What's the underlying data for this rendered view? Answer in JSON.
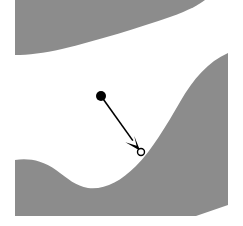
{
  "figure": {
    "width": 243,
    "height": 226,
    "background_color": "#ffffff",
    "region_color": "#8c8c8c",
    "annotation_color": "#000000",
    "marker_open_fill": "#ffffff"
  },
  "regions": [
    {
      "name": "upper-gray-region",
      "description": "Gray band across the top, tapering to a tip at upper right, concave lower edge",
      "path": "M 15 0 L 205 0 C 200 4 190 10 170 17 C 140 27 100 40 62 49 C 44 53 28 55 15 55 Z",
      "color": "#8c8c8c"
    },
    {
      "name": "lower-right-gray-region",
      "description": "Large gray region occupying the lower portion, with an S-shaped upper boundary rising to the right and a valley near the left",
      "path": "M 15 160 C 28 158 42 160 56 170 C 68 179 76 186 88 188 C 104 190 120 182 136 166 C 152 150 166 126 180 102 C 194 78 208 62 228 53 L 228 205 L 196 216 L 15 216 Z",
      "color": "#8c8c8c"
    }
  ],
  "annotation": {
    "name": "boundary-pointer-arrow",
    "start_point": {
      "x": 101,
      "y": 96,
      "marker": "filled-dot",
      "radius": 5
    },
    "end_point": {
      "x": 141,
      "y": 152,
      "marker": "open-circle",
      "radius": 3.5
    },
    "line_width": 1.6,
    "arrowhead": {
      "length": 17,
      "half_width": 7,
      "style": "solid-triangle-concave"
    }
  }
}
